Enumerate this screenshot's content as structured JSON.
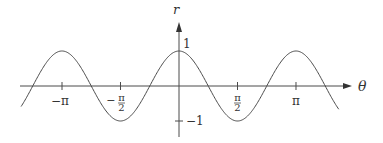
{
  "chart_data": {
    "type": "line",
    "title": "",
    "function": "r = cos(2θ)",
    "xlabel": "θ",
    "ylabel": "r",
    "x_ticks": [
      {
        "value": -3.14159,
        "label": "−π"
      },
      {
        "value": -1.5708,
        "label": "−π/2",
        "num": "π",
        "den": "2",
        "sign": "−"
      },
      {
        "value": 1.5708,
        "label": "π/2",
        "num": "π",
        "den": "2",
        "sign": ""
      },
      {
        "value": 3.14159,
        "label": "π"
      }
    ],
    "y_ticks": [
      {
        "value": 1,
        "label": "1"
      },
      {
        "value": -1,
        "label": "−1"
      }
    ],
    "xlim": [
      -4.25,
      5.2
    ],
    "ylim": [
      -1.45,
      1.6
    ],
    "grid": false,
    "legend": null,
    "series": [
      {
        "name": "cos(2θ)",
        "x_start": -4.24,
        "x_end": 4.29,
        "sample_points": [
          {
            "x": -4.24,
            "y": -0.59
          },
          {
            "x": -3.93,
            "y": 0.0
          },
          {
            "x": -3.14,
            "y": 1.0
          },
          {
            "x": -2.36,
            "y": 0.0
          },
          {
            "x": -1.57,
            "y": -1.0
          },
          {
            "x": -0.79,
            "y": 0.0
          },
          {
            "x": 0.0,
            "y": 1.0
          },
          {
            "x": 0.79,
            "y": 0.0
          },
          {
            "x": 1.57,
            "y": -1.0
          },
          {
            "x": 2.36,
            "y": 0.0
          },
          {
            "x": 3.14,
            "y": 1.0
          },
          {
            "x": 3.93,
            "y": 0.0
          },
          {
            "x": 4.29,
            "y": -0.65
          }
        ]
      }
    ]
  },
  "colors": {
    "curve": "#4a4a4a",
    "axis": "#4a4a4a",
    "text": "#333333"
  }
}
